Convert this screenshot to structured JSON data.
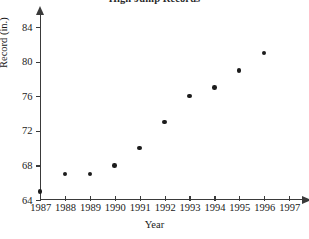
{
  "chart_data": {
    "type": "scatter",
    "title": "High Jump Records",
    "xlabel": "Year",
    "ylabel": "Record (in.)",
    "x": [
      1987,
      1988,
      1989,
      1990,
      1991,
      1992,
      1993,
      1994,
      1995,
      1996
    ],
    "values": [
      65,
      67,
      67,
      68,
      70,
      73,
      76,
      77,
      79,
      81
    ],
    "points": [
      {
        "year": 1987,
        "record": 65
      },
      {
        "year": 1988,
        "record": 67
      },
      {
        "year": 1989,
        "record": 67
      },
      {
        "year": 1990,
        "record": 68
      },
      {
        "year": 1991,
        "record": 70
      },
      {
        "year": 1992,
        "record": 73
      },
      {
        "year": 1993,
        "record": 76
      },
      {
        "year": 1994,
        "record": 77
      },
      {
        "year": 1995,
        "record": 79
      },
      {
        "year": 1996,
        "record": 81
      }
    ],
    "xlim": [
      1987,
      1997
    ],
    "ylim": [
      64,
      85.5
    ],
    "xticks": [
      1987,
      1988,
      1989,
      1990,
      1991,
      1992,
      1993,
      1994,
      1995,
      1996,
      1997
    ],
    "yticks": [
      64,
      68,
      72,
      76,
      80,
      84
    ],
    "grid": false,
    "legend": null,
    "marker_color": "#1c1c1c",
    "axis_color": "#3a3a3a"
  }
}
